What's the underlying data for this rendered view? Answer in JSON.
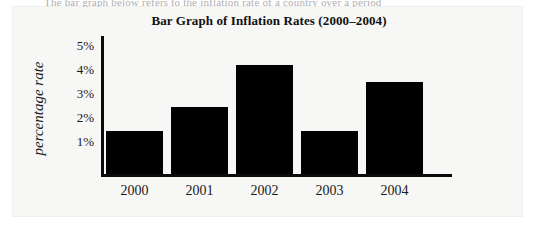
{
  "page": {
    "cut_text": "The bar graph below refers to the inflation rate of a country over a period",
    "background_color": "#f7f7f5"
  },
  "chart_data": {
    "type": "bar",
    "title": "Bar Graph of Inflation Rates (2000–2004)",
    "xlabel": "",
    "ylabel": "percentage rate",
    "categories": [
      "2000",
      "2001",
      "2002",
      "2003",
      "2004"
    ],
    "values": [
      1.8,
      2.8,
      4.6,
      1.8,
      3.85
    ],
    "ytick_labels": [
      "5%",
      "4%",
      "3%",
      "2%",
      "1%"
    ],
    "ytick_values": [
      5,
      4,
      3,
      2,
      1
    ],
    "ylim": [
      0,
      5.8
    ],
    "grid": false,
    "legend": false,
    "bar_color": "#000000",
    "axis_color": "#0a0a0a"
  }
}
